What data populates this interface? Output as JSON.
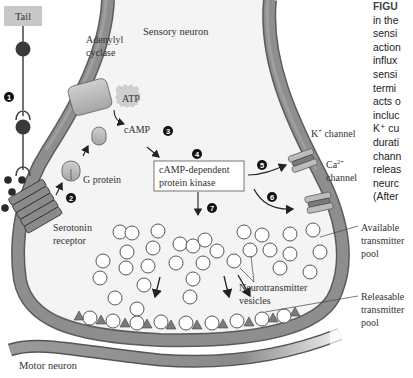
{
  "labels": {
    "tail": "Tail",
    "sensory_neuron": "Sensory neuron",
    "adenylyl_cyclase_1": "Adenylyl",
    "adenylyl_cyclase_2": "cyclase",
    "atp": "ATP",
    "camp": "cAMP",
    "g_protein": "G protein",
    "serotonin_receptor_1": "Serotonin",
    "serotonin_receptor_2": "receptor",
    "pka_1": "cAMP-dependent",
    "pka_2": "protein kinase",
    "k_channel": "K",
    "k_sup": "+",
    "k_channel_word": " channel",
    "ca_channel": "Ca",
    "ca_sup": "2+",
    "ca_channel_word": "channel",
    "available_pool_1": "Available",
    "available_pool_2": "transmitter",
    "available_pool_3": "pool",
    "neurotransmitter_vesicles_1": "Neurotransmitter",
    "neurotransmitter_vesicles_2": "vesicles",
    "releasable_pool_1": "Releasable",
    "releasable_pool_2": "transmitter",
    "releasable_pool_3": "pool",
    "motor_neuron": "Motor neuron"
  },
  "steps": [
    "1",
    "2",
    "3",
    "4",
    "5",
    "6",
    "7"
  ],
  "caption": {
    "lines": [
      "FIGU",
      "in the",
      "sensi",
      "action",
      "influx",
      "sensi",
      "termi",
      "acts o",
      "incluc",
      "K⁺ cu",
      "durati",
      "chann",
      "releas",
      "neurc",
      "(After"
    ]
  },
  "colors": {
    "membrane": "#8a8a8a",
    "membrane_dark": "#6e6e6e",
    "protein": "#b8b8b8",
    "protein_dark": "#7c7c7c",
    "tail_box": "#c8c8c8",
    "dot": "#3a3a3a",
    "text": "#333333"
  }
}
